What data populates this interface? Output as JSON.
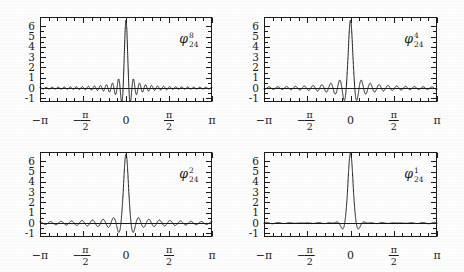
{
  "figure": {
    "background": "#ffffff",
    "ink": "#1a1a1a",
    "panel_count": 4
  },
  "chart_data": [
    {
      "type": "line",
      "title": "",
      "label": "φ",
      "label_superscript": "8",
      "label_subscript": "24",
      "label_position": "top-right",
      "xlabel": "",
      "ylabel": "",
      "xlim": [
        -3.14159,
        3.14159
      ],
      "ylim": [
        -1.35,
        6.9
      ],
      "xtick_labels": [
        "−π",
        "−π/2",
        "0",
        "π/2",
        "π"
      ],
      "xtick_values": [
        -3.14159,
        -1.5708,
        0,
        1.5708,
        3.14159
      ],
      "ytick_labels": [
        "6",
        "5",
        "4",
        "3",
        "2",
        "1",
        "0",
        "-1"
      ],
      "ytick_values": [
        6,
        5,
        4,
        3,
        2,
        1,
        0,
        -1
      ],
      "minor_xticks": 20,
      "grid": false,
      "legend": "none",
      "zero_line": true,
      "peak_value": 6.6,
      "peak_x": 0,
      "main_lobe_half_width": 0.11,
      "ripple_decay": 9.0,
      "ripple_period": 0.3,
      "ripple_amplitude": 0.75,
      "kernel_order": 8,
      "kernel_n": 24
    },
    {
      "type": "line",
      "title": "",
      "label": "φ",
      "label_superscript": "4",
      "label_subscript": "24",
      "label_position": "top-right",
      "xlabel": "",
      "ylabel": "",
      "xlim": [
        -3.14159,
        3.14159
      ],
      "ylim": [
        -1.35,
        6.9
      ],
      "xtick_labels": [
        "−π",
        "−π/2",
        "0",
        "π/2",
        "π"
      ],
      "xtick_values": [
        -3.14159,
        -1.5708,
        0,
        1.5708,
        3.14159
      ],
      "ytick_labels": [
        "6",
        "5",
        "4",
        "3",
        "2",
        "1",
        "0",
        "-1"
      ],
      "ytick_values": [
        6,
        5,
        4,
        3,
        2,
        1,
        0,
        -1
      ],
      "minor_xticks": 20,
      "grid": false,
      "legend": "none",
      "zero_line": true,
      "peak_value": 6.6,
      "peak_x": 0,
      "main_lobe_half_width": 0.16,
      "ripple_decay": 5.0,
      "ripple_period": 0.36,
      "ripple_amplitude": 1.0,
      "kernel_order": 4,
      "kernel_n": 24
    },
    {
      "type": "line",
      "title": "",
      "label": "φ",
      "label_superscript": "2",
      "label_subscript": "24",
      "label_position": "top-right",
      "xlabel": "",
      "ylabel": "",
      "xlim": [
        -3.14159,
        3.14159
      ],
      "ylim": [
        -1.35,
        6.9
      ],
      "xtick_labels": [
        "−π",
        "−π/2",
        "0",
        "π/2",
        "π"
      ],
      "xtick_values": [
        -3.14159,
        -1.5708,
        0,
        1.5708,
        3.14159
      ],
      "ytick_labels": [
        "6",
        "5",
        "4",
        "3",
        "2",
        "1",
        "0",
        "-1"
      ],
      "ytick_values": [
        6,
        5,
        4,
        3,
        2,
        1,
        0,
        -1
      ],
      "minor_xticks": 20,
      "grid": false,
      "legend": "none",
      "zero_line": true,
      "peak_value": 6.7,
      "peak_x": 0,
      "main_lobe_half_width": 0.19,
      "ripple_decay": 2.2,
      "ripple_period": 0.4,
      "ripple_amplitude": 1.15,
      "kernel_order": 2,
      "kernel_n": 24
    },
    {
      "type": "line",
      "title": "",
      "label": "φ",
      "label_superscript": "1",
      "label_subscript": "24",
      "label_position": "top-right",
      "xlabel": "",
      "ylabel": "",
      "xlim": [
        -3.14159,
        3.14159
      ],
      "ylim": [
        -1.35,
        6.9
      ],
      "xtick_labels": [
        "−π",
        "−π/2",
        "0",
        "π/2",
        "π"
      ],
      "xtick_values": [
        -3.14159,
        -1.5708,
        0,
        1.5708,
        3.14159
      ],
      "ytick_labels": [
        "6",
        "5",
        "4",
        "3",
        "2",
        "1",
        "0",
        "-1"
      ],
      "ytick_values": [
        6,
        5,
        4,
        3,
        2,
        1,
        0,
        -1
      ],
      "minor_xticks": 20,
      "grid": false,
      "legend": "none",
      "zero_line": true,
      "peak_value": 6.8,
      "peak_x": 0,
      "main_lobe_half_width": 0.21,
      "ripple_decay": 0.9,
      "ripple_period": 0.42,
      "ripple_amplitude": 1.25,
      "kernel_order": 1,
      "kernel_n": 24
    }
  ],
  "panels": [
    {
      "id": "panel-top-left",
      "x": 40,
      "y": 17,
      "w": 172,
      "h": 85
    },
    {
      "id": "panel-top-right",
      "x": 264,
      "y": 17,
      "w": 173,
      "h": 85
    },
    {
      "id": "panel-bottom-left",
      "x": 40,
      "y": 152,
      "w": 172,
      "h": 85
    },
    {
      "id": "panel-bottom-right",
      "x": 264,
      "y": 152,
      "w": 173,
      "h": 85
    }
  ]
}
